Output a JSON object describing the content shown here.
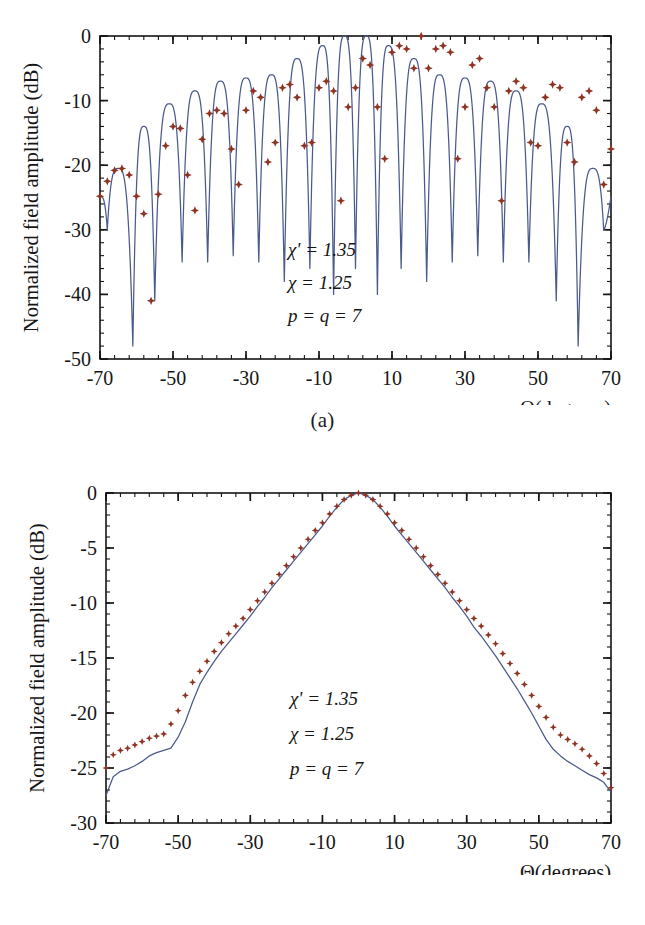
{
  "document": {
    "type": "scientific-figure",
    "panels": [
      "a",
      "b"
    ]
  },
  "panel_a": {
    "caption": "(a)",
    "axis": {
      "xlabel": "Θ(degrees)",
      "ylabel": "Normalized field amplitude (dB)",
      "xticks": [
        "-70",
        "-50",
        "-30",
        "-10",
        "10",
        "30",
        "50",
        "70"
      ],
      "yticks": [
        "0",
        "-10",
        "-20",
        "-30",
        "-40",
        "-50"
      ]
    },
    "annotations": {
      "line1": "χ' = 1.35",
      "line2": "χ = 1.25",
      "line3": "p = q = 7"
    }
  },
  "panel_b": {
    "caption": "(b)",
    "axis": {
      "xlabel": "Θ(degrees)",
      "ylabel": "Normalized field amplitude (dB)",
      "xticks": [
        "-70",
        "-50",
        "-30",
        "-10",
        "10",
        "30",
        "50",
        "70"
      ],
      "yticks": [
        "0",
        "-5",
        "-10",
        "-15",
        "-20",
        "-25",
        "-30"
      ]
    },
    "annotations": {
      "line1": "χ' = 1.35",
      "line2": "χ = 1.25",
      "line3": "p = q = 7"
    }
  },
  "colors": {
    "curve": "#4a5a8c",
    "markers": "#8f3322",
    "axis": "#151515",
    "background": "#ffffff"
  },
  "chart_data": [
    {
      "id": "panel-a",
      "type": "line",
      "title": "",
      "xlabel": "Θ(degrees)",
      "ylabel": "Normalized field amplitude (dB)",
      "xlim": [
        -70,
        70
      ],
      "ylim": [
        -50,
        0
      ],
      "xticks": [
        -70,
        -50,
        -30,
        -10,
        10,
        30,
        50,
        70
      ],
      "yticks": [
        0,
        -10,
        -20,
        -30,
        -40,
        -50
      ],
      "xminor_step": 4,
      "yminor_step": 2,
      "grid": false,
      "legend": null,
      "annotations": [
        "χ' = 1.35",
        "χ = 1.25",
        "p = q = 7"
      ],
      "description": "Array-factor pattern with many sharp nulls; lobe peaks tapering from 0 dB at broadside to about -21 dB near +/-65 degrees; nulls reach -35 to -48 dB.",
      "series": [
        {
          "name": "theory-curve",
          "style": "solid-line",
          "color": "#4a5a8c",
          "envelope_peaks": {
            "x": [
              -65,
              -58,
              -51,
              -44,
              -37,
              -30,
              -23,
              -16,
              -9,
              -3,
              3,
              9,
              16,
              23,
              30,
              37,
              44,
              51,
              58,
              65
            ],
            "y": [
              -20.5,
              -14.0,
              -10.5,
              -8.5,
              -7.0,
              -6.5,
              -6.0,
              -3.5,
              -1.5,
              0.0,
              0.0,
              -1.5,
              -3.5,
              -6.0,
              -6.5,
              -7.0,
              -8.5,
              -10.5,
              -14.0,
              -20.5
            ]
          },
          "nulls": {
            "x": [
              -68,
              -61,
              -55,
              -47.5,
              -40.5,
              -33.5,
              -26.5,
              -19.5,
              -12.5,
              -6,
              0,
              6,
              12.5,
              19.5,
              26.5,
              33.5,
              40.5,
              47.5,
              55,
              61,
              68
            ],
            "y": [
              -30,
              -48,
              -41,
              -35,
              -35,
              -34,
              -35,
              -38,
              -36,
              -40,
              -36,
              -40,
              -36,
              -38,
              -35,
              -34,
              -35,
              -35,
              -41,
              -48,
              -30
            ]
          }
        },
        {
          "name": "measured-points",
          "style": "star-markers",
          "color": "#8f3322",
          "x": [
            -70,
            -68,
            -66,
            -64,
            -62,
            -60,
            -58,
            -56,
            -54,
            -52,
            -50,
            -48,
            -46,
            -44,
            -42,
            -40,
            -38,
            -36,
            -34,
            -32,
            -30,
            -28,
            -26,
            -24,
            -22,
            -20,
            -18,
            -16,
            -14,
            -12,
            -10,
            -8,
            -6,
            -4,
            -2,
            0,
            2,
            4,
            6,
            8,
            10,
            12,
            14,
            16,
            18,
            20,
            22,
            24,
            26,
            28,
            30,
            32,
            34,
            36,
            38,
            40,
            42,
            44,
            46,
            48,
            50,
            52,
            54,
            56,
            58,
            60,
            62,
            64,
            66,
            68,
            70
          ],
          "y": [
            -24.8,
            -22.5,
            -20.8,
            -20.5,
            -21.5,
            -24.8,
            -27.5,
            -41.0,
            -24.5,
            -17.0,
            -14.0,
            -14.3,
            -21.5,
            -27.0,
            -16.0,
            -12.0,
            -11.5,
            -12.0,
            -17.5,
            -23.0,
            -11.5,
            -8.5,
            -9.5,
            -19.5,
            -16.5,
            -8.0,
            -7.5,
            -9.5,
            -17.0,
            -16.5,
            -8.0,
            -7.0,
            -8.5,
            -25.5,
            -11.0,
            -8.0,
            -3.5,
            -4.5,
            -11.0,
            -19.0,
            -2.5,
            -1.5,
            -2.0,
            -5.0,
            0.0,
            -5.0,
            -2.0,
            -1.5,
            -2.5,
            -19.0,
            -11.0,
            -4.5,
            -3.5,
            -8.0,
            -11.0,
            -25.5,
            -8.5,
            -7.0,
            -8.0,
            -16.5,
            -17.0,
            -9.5,
            -7.5,
            -8.0,
            -16.5,
            -19.5,
            -9.5,
            -8.5,
            -11.5,
            -23.0,
            -17.5
          ]
        }
      ]
    },
    {
      "id": "panel-b",
      "type": "line",
      "title": "",
      "xlabel": "Θ(degrees)",
      "ylabel": "Normalized field amplitude (dB)",
      "xlim": [
        -70,
        70
      ],
      "ylim": [
        -30,
        0
      ],
      "xticks": [
        -70,
        -50,
        -30,
        -10,
        10,
        30,
        50,
        70
      ],
      "yticks": [
        0,
        -5,
        -10,
        -15,
        -20,
        -25,
        -30
      ],
      "xminor_step": 4,
      "yminor_step": 1,
      "grid": false,
      "legend": null,
      "annotations": [
        "χ' = 1.35",
        "χ = 1.25",
        "p = q = 7"
      ],
      "description": "Smooth single-peak (pyramid-like) pattern peaking at 0 dB at broadside, falling roughly linearly in dB to about -25 dB near the +/-70 degree edges; marker series sits 0.5-2 dB above the solid line on the flanks.",
      "series": [
        {
          "name": "theory-curve",
          "style": "solid-line",
          "color": "#4a5a8c",
          "x": [
            -70,
            -68,
            -66,
            -64,
            -62,
            -60,
            -58,
            -56,
            -54,
            -52,
            -50,
            -48,
            -46,
            -44,
            -42,
            -40,
            -38,
            -36,
            -34,
            -32,
            -30,
            -28,
            -26,
            -24,
            -22,
            -20,
            -18,
            -16,
            -14,
            -12,
            -10,
            -8,
            -6,
            -4,
            -2,
            0,
            2,
            4,
            6,
            8,
            10,
            12,
            14,
            16,
            18,
            20,
            22,
            24,
            26,
            28,
            30,
            32,
            34,
            36,
            38,
            40,
            42,
            44,
            46,
            48,
            50,
            52,
            54,
            56,
            58,
            60,
            62,
            64,
            66,
            68,
            70
          ],
          "y": [
            -27.5,
            -25.8,
            -25.3,
            -25.1,
            -24.8,
            -24.4,
            -23.9,
            -23.6,
            -23.4,
            -23.2,
            -22.2,
            -20.8,
            -19.0,
            -17.4,
            -16.3,
            -15.3,
            -14.4,
            -13.6,
            -12.8,
            -12.0,
            -11.2,
            -10.3,
            -9.5,
            -8.6,
            -7.8,
            -7.0,
            -6.2,
            -5.4,
            -4.6,
            -3.8,
            -3.0,
            -2.1,
            -1.3,
            -0.6,
            -0.2,
            0.0,
            -0.2,
            -0.6,
            -1.3,
            -2.1,
            -3.0,
            -3.8,
            -4.6,
            -5.4,
            -6.2,
            -7.0,
            -7.8,
            -8.6,
            -9.5,
            -10.3,
            -11.2,
            -12.2,
            -13.0,
            -13.9,
            -14.8,
            -15.8,
            -16.8,
            -17.8,
            -18.9,
            -20.0,
            -21.2,
            -22.4,
            -23.3,
            -23.9,
            -24.4,
            -24.8,
            -25.2,
            -25.6,
            -25.9,
            -26.3,
            -27.2
          ]
        },
        {
          "name": "measured-points",
          "style": "star-markers",
          "color": "#8f3322",
          "x": [
            -70,
            -68,
            -66,
            -64,
            -62,
            -60,
            -58,
            -56,
            -54,
            -52,
            -50,
            -48,
            -46,
            -44,
            -42,
            -40,
            -38,
            -36,
            -34,
            -32,
            -30,
            -28,
            -26,
            -24,
            -22,
            -20,
            -18,
            -16,
            -14,
            -12,
            -10,
            -8,
            -6,
            -4,
            -2,
            0,
            2,
            4,
            6,
            8,
            10,
            12,
            14,
            16,
            18,
            20,
            22,
            24,
            26,
            28,
            30,
            32,
            34,
            36,
            38,
            40,
            42,
            44,
            46,
            48,
            50,
            52,
            54,
            56,
            58,
            60,
            62,
            64,
            66,
            68,
            70
          ],
          "y": [
            -25.0,
            -23.8,
            -23.4,
            -23.2,
            -22.9,
            -22.6,
            -22.3,
            -22.1,
            -21.9,
            -21.0,
            -19.8,
            -18.4,
            -17.2,
            -16.2,
            -15.3,
            -14.4,
            -13.6,
            -12.8,
            -12.1,
            -11.4,
            -10.6,
            -9.8,
            -9.0,
            -8.2,
            -7.4,
            -6.6,
            -5.8,
            -5.0,
            -4.2,
            -3.4,
            -2.7,
            -1.9,
            -1.2,
            -0.6,
            -0.2,
            0.0,
            -0.2,
            -0.6,
            -1.2,
            -1.9,
            -2.7,
            -3.4,
            -4.2,
            -5.0,
            -5.8,
            -6.6,
            -7.4,
            -8.2,
            -9.0,
            -9.8,
            -10.6,
            -11.4,
            -12.1,
            -12.9,
            -13.7,
            -14.6,
            -15.5,
            -16.4,
            -17.4,
            -18.4,
            -19.4,
            -20.4,
            -21.3,
            -22.0,
            -22.4,
            -22.8,
            -23.3,
            -23.9,
            -24.6,
            -25.5,
            -26.8
          ]
        }
      ]
    }
  ]
}
